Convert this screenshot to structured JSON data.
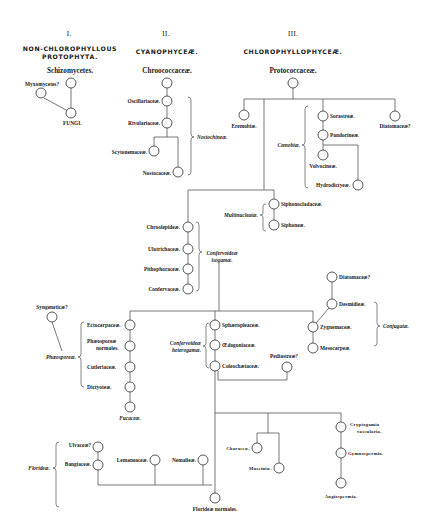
{
  "diagram": {
    "columns": [
      {
        "numeral": "I.",
        "title_line1": "NON-CHLOROPHYLLOUS",
        "title_line2": "PROTOPHYTA.",
        "subtitle": "Schizomycetes."
      },
      {
        "numeral": "II.",
        "title": "CYANOPHYCEÆ.",
        "subtitle": "Chroococcaceæ."
      },
      {
        "numeral": "III.",
        "title": "CHLOROPHYLLOPHYCEÆ.",
        "subtitle": "Protococcaceæ."
      }
    ],
    "nodes": {
      "myxomycetes": "Myxomycetes?",
      "fungi": "FUNGI.",
      "oscillariaceae": "Oscillariaceæ.",
      "rivulariaceae": "Rivulariaceæ.",
      "scytonemaceae": "Scytonemaceæ.",
      "nostocaceae": "Nostocaceæ.",
      "eremobiae": "Eremobiæ.",
      "sorastreae": "Sorastreæ.",
      "pandorineae": "Pandorineæ.",
      "volvocineae": "Volvocineæ.",
      "hydrodictyeae": "Hydrodictyeæ.",
      "diatomaceae_top": "Diatomaceæ?",
      "siphonocladaceae": "Siphonocladaceæ.",
      "siphoneae": "Siphoneæ.",
      "chroolepideae": "Chroolepideæ.",
      "ulotrichaceae": "Ulotrichaceæ.",
      "pithophoraceae": "Pithophoraceæ.",
      "confervaceae": "Confervaceæ.",
      "diatomaceae_mid": "Diatomaceæ?",
      "desmidieae": "Desmidieæ.",
      "zygnemaceae": "Zygnemaceæ.",
      "mesocarpeae": "Mesocarpeæ.",
      "syngeneticae": "Syngeneticæ?",
      "ectocarpaceae": "Ectocarpaceæ.",
      "phaeosporeae_normales_1": "Phæosporeæ",
      "phaeosporeae_normales_2": "normales.",
      "cutleriaceae": "Cutleriaceæ.",
      "dictyoteae": "Dictyoteæ.",
      "fucaceae": "Fucaceæ.",
      "sphaeropleaceae": "Sphæropleaceæ.",
      "oedogoniaceae": "Œdogoniaceæ.",
      "coleochaetaceae": "Coleochætaceæ.",
      "pediastreae": "Pediastreæ?",
      "ulvaceae": "Ulvaceæ?",
      "bangiaceae": "Bangiaceæ.",
      "lemaneaceae": "Lemaneaceæ.",
      "nemalieae": "Nemalieæ.",
      "florideae_normales": "Florideæ normales.",
      "characeae": "Characeæ.",
      "musciniae": "Musciniæ.",
      "cryptogamia_1": "Cryptogamia",
      "cryptogamia_2": "vascularia.",
      "gymnospermia": "Gymnospermia.",
      "angiospermia": "Angiospermia."
    },
    "groups": {
      "nostochineae": "Nostochineæ.",
      "coenobiae": "Cœnobiæ.",
      "multinucleatae": "Multinucleatæ.",
      "confervoideae_isogamae_1": "Confervoideæ",
      "confervoideae_isogamae_2": "isogamæ.",
      "conjugatae": "Conjugatæ.",
      "phaeosporeae": "Phæosporeæ.",
      "confervoideae_heterogamae_1": "Confervoideæ",
      "confervoideae_heterogamae_2": "heterogamæ.",
      "florideae": "Florideæ."
    },
    "colors": {
      "ink": "#222222",
      "line": "#555555",
      "background": "#ffffff"
    }
  }
}
